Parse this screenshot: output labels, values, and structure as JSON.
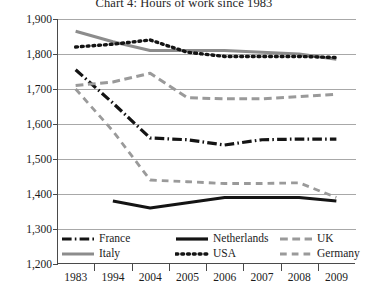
{
  "chart_data": {
    "type": "line",
    "title": "Chart 4: Hours of work since 1983",
    "xlabel": "",
    "ylabel": "annual hours worked",
    "x": [
      "1983",
      "1994",
      "2004",
      "2005",
      "2006",
      "2007",
      "2008",
      "2009"
    ],
    "ylim": [
      1200,
      1900
    ],
    "yticks": [
      1900,
      1800,
      1700,
      1600,
      1500,
      1400,
      1300,
      1200
    ],
    "ytick_labels": [
      "1,900",
      "1,800",
      "1,700",
      "1,600",
      "1,500",
      "1,400",
      "1,300",
      "1,200"
    ],
    "grid": true,
    "legend_position": "bottom-inside",
    "series": [
      {
        "name": "France",
        "style": "dash-dot",
        "color": "#141414",
        "width": 3.2,
        "values": [
          1755,
          1660,
          1560,
          1555,
          1540,
          1555,
          1557,
          1557
        ]
      },
      {
        "name": "Italy",
        "style": "solid",
        "color": "#8c8c8c",
        "width": 3.0,
        "values": [
          1865,
          1835,
          1810,
          1810,
          1810,
          1805,
          1800,
          1785
        ]
      },
      {
        "name": "Netherlands",
        "style": "solid",
        "color": "#141414",
        "width": 3.2,
        "values": [
          null,
          1380,
          1360,
          1375,
          1390,
          1390,
          1390,
          1380
        ]
      },
      {
        "name": "USA",
        "style": "dotted",
        "color": "#141414",
        "width": 3.4,
        "values": [
          1820,
          1828,
          1840,
          1805,
          1793,
          1793,
          1793,
          1790
        ]
      },
      {
        "name": "UK",
        "style": "dashed",
        "color": "#9a9a9a",
        "width": 3.0,
        "values": [
          1710,
          1720,
          1745,
          1675,
          1672,
          1672,
          1678,
          1685
        ]
      },
      {
        "name": "Germany",
        "style": "dashed-thin",
        "color": "#9a9a9a",
        "width": 2.8,
        "values": [
          1700,
          1580,
          1440,
          1435,
          1430,
          1430,
          1432,
          1390
        ]
      }
    ]
  },
  "legend": {
    "items": [
      {
        "label": "France",
        "swatch": "dash-dot-dark"
      },
      {
        "label": "Netherlands",
        "swatch": "solid-dark"
      },
      {
        "label": "UK",
        "swatch": "dashed-gray"
      },
      {
        "label": "Italy",
        "swatch": "solid-gray"
      },
      {
        "label": "USA",
        "swatch": "dotted-dark"
      },
      {
        "label": "Germany",
        "swatch": "dashed-thin-gray"
      }
    ]
  }
}
